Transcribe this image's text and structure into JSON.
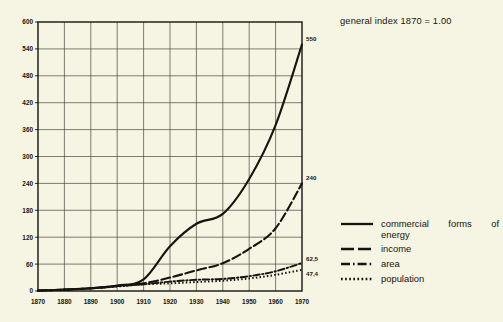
{
  "note": {
    "text": "general index 1870 = 1.00"
  },
  "axes": {
    "y_ticks": [
      "0",
      "60",
      "120",
      "180",
      "240",
      "300",
      "360",
      "420",
      "480",
      "540",
      "600"
    ],
    "x_ticks": [
      "1870",
      "1880",
      "1890",
      "1900",
      "1910",
      "1920",
      "1930",
      "1940",
      "1950",
      "1960",
      "1970"
    ],
    "xlim": [
      1870,
      1970
    ],
    "ylim": [
      0,
      600
    ]
  },
  "end_labels": {
    "energy": "550",
    "income": "240",
    "area": "62,5",
    "population": "47,4"
  },
  "legend": {
    "items": [
      {
        "label_line1": "commercial  forms  of",
        "label_line2": "energy",
        "style": "solid",
        "name": "energy"
      },
      {
        "label_line1": "income",
        "label_line2": "",
        "style": "dashed",
        "name": "income"
      },
      {
        "label_line1": "area",
        "label_line2": "",
        "style": "dashdot",
        "name": "area"
      },
      {
        "label_line1": "population",
        "label_line2": "",
        "style": "dotted",
        "name": "population"
      }
    ]
  },
  "colors": {
    "background": "#f6f4e2",
    "ink": "#15140f",
    "grid": "#4a4940"
  },
  "chart_data": {
    "type": "line",
    "title": "",
    "subtitle": "general index 1870 = 1.00",
    "xlabel": "",
    "ylabel": "",
    "xlim": [
      1870,
      1970
    ],
    "ylim": [
      0,
      600
    ],
    "grid": true,
    "legend_position": "right",
    "x": [
      1870,
      1880,
      1890,
      1900,
      1910,
      1920,
      1930,
      1940,
      1950,
      1960,
      1970
    ],
    "series": [
      {
        "name": "commercial forms of energy",
        "style": "solid",
        "end_value": 550,
        "values": [
          1,
          3,
          6,
          12,
          26,
          100,
          150,
          172,
          250,
          370,
          550
        ]
      },
      {
        "name": "income",
        "style": "dashed",
        "end_value": 240,
        "values": [
          1,
          3,
          6,
          11,
          17,
          30,
          46,
          62,
          94,
          140,
          240
        ]
      },
      {
        "name": "area",
        "style": "dashdot",
        "end_value": 62.5,
        "values": [
          1,
          3,
          6,
          11,
          15,
          21,
          25,
          27,
          33,
          44,
          62.5
        ]
      },
      {
        "name": "population",
        "style": "dotted",
        "end_value": 47.4,
        "values": [
          1,
          3,
          6,
          10,
          15,
          17,
          20,
          23,
          28,
          36,
          47.4
        ]
      }
    ]
  }
}
